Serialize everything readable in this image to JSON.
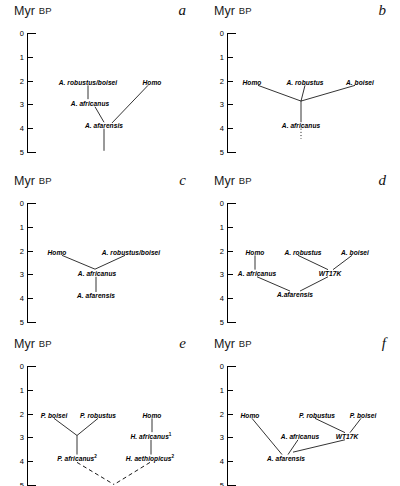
{
  "figure": {
    "axis_title_main": "Myr",
    "axis_title_sub": "BP",
    "tick_labels": [
      "0",
      "1",
      "2",
      "3",
      "4",
      "5"
    ],
    "axis_min": 0,
    "axis_max": 5
  },
  "panels": [
    {
      "letter": "a",
      "nodes": [
        {
          "label": "A. robustus/boisei",
          "sup": "",
          "x": 88,
          "myr": 2.05
        },
        {
          "label": "A. africanus",
          "sup": "",
          "x": 90,
          "myr": 2.95
        },
        {
          "label": "A. afarensis",
          "sup": "",
          "x": 104,
          "myr": 3.88
        },
        {
          "label": "Homo",
          "sup": "",
          "x": 152,
          "myr": 2.05
        }
      ],
      "links": [
        {
          "x1": 88,
          "y1": 2.2,
          "x2": 88,
          "y2": 2.78,
          "style": "solid"
        },
        {
          "x1": 95,
          "y1": 3.1,
          "x2": 104,
          "y2": 3.75,
          "style": "solid"
        },
        {
          "x1": 148,
          "y1": 2.2,
          "x2": 112,
          "y2": 3.78,
          "style": "solid"
        },
        {
          "x1": 104,
          "y1": 4.02,
          "x2": 104,
          "y2": 4.95,
          "style": "solid"
        }
      ]
    },
    {
      "letter": "b",
      "nodes": [
        {
          "label": "Homo",
          "sup": "",
          "x": 52,
          "myr": 2.05
        },
        {
          "label": "A. robustus",
          "sup": "",
          "x": 105,
          "myr": 2.05
        },
        {
          "label": "A. boisei",
          "sup": "",
          "x": 160,
          "myr": 2.05
        },
        {
          "label": "A. africanus",
          "sup": "",
          "x": 101,
          "myr": 3.88
        }
      ],
      "links": [
        {
          "x1": 58,
          "y1": 2.2,
          "x2": 101,
          "y2": 2.86,
          "style": "solid"
        },
        {
          "x1": 105,
          "y1": 2.2,
          "x2": 101,
          "y2": 2.86,
          "style": "solid"
        },
        {
          "x1": 155,
          "y1": 2.2,
          "x2": 101,
          "y2": 2.86,
          "style": "solid"
        },
        {
          "x1": 101,
          "y1": 2.86,
          "x2": 101,
          "y2": 3.75,
          "style": "solid"
        },
        {
          "x1": 101,
          "y1": 4.02,
          "x2": 101,
          "y2": 4.45,
          "style": "dotted"
        }
      ]
    },
    {
      "letter": "c",
      "nodes": [
        {
          "label": "Homo",
          "sup": "",
          "x": 57,
          "myr": 2.05
        },
        {
          "label": "A. robustus/boisei",
          "sup": "",
          "x": 131,
          "myr": 2.05
        },
        {
          "label": "A. africanus",
          "sup": "",
          "x": 97,
          "myr": 2.95
        },
        {
          "label": "A. afarensis",
          "sup": "",
          "x": 96,
          "myr": 3.88
        }
      ],
      "links": [
        {
          "x1": 62,
          "y1": 2.2,
          "x2": 95,
          "y2": 2.78,
          "style": "solid"
        },
        {
          "x1": 125,
          "y1": 2.2,
          "x2": 95,
          "y2": 2.78,
          "style": "solid"
        },
        {
          "x1": 96,
          "y1": 3.1,
          "x2": 96,
          "y2": 3.74,
          "style": "solid"
        }
      ]
    },
    {
      "letter": "d",
      "nodes": [
        {
          "label": "Homo",
          "sup": "",
          "x": 55,
          "myr": 2.05
        },
        {
          "label": "A. robustus",
          "sup": "",
          "x": 103,
          "myr": 2.05
        },
        {
          "label": "A. boisei",
          "sup": "",
          "x": 155,
          "myr": 2.05
        },
        {
          "label": "A. africanus",
          "sup": "",
          "x": 57,
          "myr": 2.95
        },
        {
          "label": "WT17K",
          "sup": "",
          "x": 130,
          "myr": 2.95
        },
        {
          "label": "A.afarensis",
          "sup": "",
          "x": 95,
          "myr": 3.82
        }
      ],
      "links": [
        {
          "x1": 55,
          "y1": 2.2,
          "x2": 55,
          "y2": 2.8,
          "style": "solid"
        },
        {
          "x1": 98,
          "y1": 2.2,
          "x2": 128,
          "y2": 2.8,
          "style": "solid"
        },
        {
          "x1": 152,
          "y1": 2.2,
          "x2": 133,
          "y2": 2.8,
          "style": "solid"
        },
        {
          "x1": 57,
          "y1": 3.1,
          "x2": 90,
          "y2": 3.7,
          "style": "solid"
        },
        {
          "x1": 128,
          "y1": 3.1,
          "x2": 100,
          "y2": 3.7,
          "style": "solid"
        }
      ]
    },
    {
      "letter": "e",
      "nodes": [
        {
          "label": "P. boisei",
          "sup": "",
          "x": 54,
          "myr": 2.05
        },
        {
          "label": "P. robustus",
          "sup": "",
          "x": 98,
          "myr": 2.05
        },
        {
          "label": "Homo",
          "sup": "",
          "x": 152,
          "myr": 2.05
        },
        {
          "label": "H. africanus",
          "sup": "1",
          "x": 151,
          "myr": 2.95
        },
        {
          "label": "P. africanus",
          "sup": "2",
          "x": 77,
          "myr": 3.88
        },
        {
          "label": "H. aethiopicus",
          "sup": "2",
          "x": 150,
          "myr": 3.88
        }
      ],
      "links": [
        {
          "x1": 54,
          "y1": 2.2,
          "x2": 77,
          "y2": 2.92,
          "style": "solid"
        },
        {
          "x1": 98,
          "y1": 2.2,
          "x2": 77,
          "y2": 2.92,
          "style": "solid"
        },
        {
          "x1": 77,
          "y1": 2.92,
          "x2": 77,
          "y2": 3.72,
          "style": "solid"
        },
        {
          "x1": 152,
          "y1": 2.2,
          "x2": 152,
          "y2": 2.78,
          "style": "solid"
        },
        {
          "x1": 151,
          "y1": 3.1,
          "x2": 151,
          "y2": 3.72,
          "style": "solid"
        },
        {
          "x1": 77,
          "y1": 4.05,
          "x2": 114,
          "y2": 4.98,
          "style": "dashed"
        },
        {
          "x1": 150,
          "y1": 4.05,
          "x2": 114,
          "y2": 4.98,
          "style": "dashed"
        }
      ]
    },
    {
      "letter": "f",
      "nodes": [
        {
          "label": "Homo",
          "sup": "",
          "x": 50,
          "myr": 2.05
        },
        {
          "label": "P. robustus",
          "sup": "",
          "x": 117,
          "myr": 2.05
        },
        {
          "label": "P. boisei",
          "sup": "",
          "x": 163,
          "myr": 2.05
        },
        {
          "label": "A. africanus",
          "sup": "",
          "x": 100,
          "myr": 2.95
        },
        {
          "label": "WT17K",
          "sup": "",
          "x": 147,
          "myr": 2.95
        },
        {
          "label": "A. afarensis",
          "sup": "",
          "x": 86,
          "myr": 3.88
        }
      ],
      "links": [
        {
          "x1": 52,
          "y1": 2.2,
          "x2": 82,
          "y2": 3.72,
          "style": "solid"
        },
        {
          "x1": 115,
          "y1": 2.2,
          "x2": 145,
          "y2": 2.8,
          "style": "solid"
        },
        {
          "x1": 161,
          "y1": 2.2,
          "x2": 150,
          "y2": 2.8,
          "style": "solid"
        },
        {
          "x1": 98,
          "y1": 3.1,
          "x2": 88,
          "y2": 3.72,
          "style": "solid"
        },
        {
          "x1": 145,
          "y1": 3.1,
          "x2": 93,
          "y2": 3.62,
          "style": "solid"
        }
      ]
    }
  ]
}
